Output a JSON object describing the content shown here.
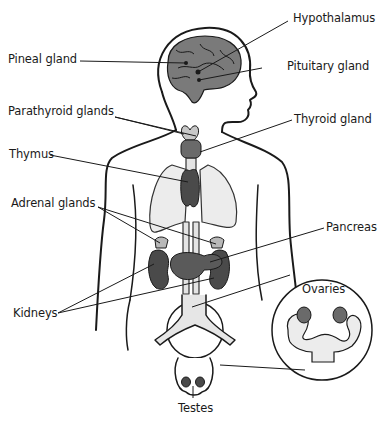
{
  "diagram": {
    "labels": {
      "hypothalamus": "Hypothalamus",
      "pineal_gland": "Pineal gland",
      "pituitary_gland": "Pituitary gland",
      "parathyroid_glands": "Parathyroid glands",
      "thyroid_gland": "Thyroid gland",
      "thymus": "Thymus",
      "adrenal_glands": "Adrenal glands",
      "pancreas": "Pancreas",
      "kidneys": "Kidneys",
      "ovaries": "Ovaries",
      "testes": "Testes"
    },
    "colors": {
      "outline": "#1a1a1a",
      "gland_dark": "#555555",
      "gland_mid": "#7a7a7a",
      "gland_light": "#b8b8b8",
      "lung_fill": "#ececec",
      "background": "#ffffff"
    }
  }
}
